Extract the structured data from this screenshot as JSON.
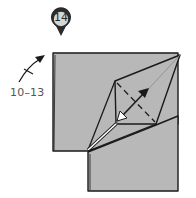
{
  "step": {
    "number": "14",
    "badge_fill": "#d6d6d6",
    "badge_stroke": "#2b2b2b"
  },
  "reference": {
    "label": "10–13",
    "arrow": "repeat-steps-arrow"
  },
  "paper": {
    "fill": "#b8b8b8",
    "edge": "#1a1a1a"
  },
  "annotations": {
    "fold_arrow": "double-headed-fold-arrow",
    "valley_lines": "dashed-crease-lines",
    "highlight_edge": "white-open-edge"
  },
  "colors": {
    "background": "#ffffff",
    "paper": "#b8b8b8",
    "lines": "#1a1a1a",
    "crease": "#8a8a8a",
    "highlight": "#ffffff"
  }
}
